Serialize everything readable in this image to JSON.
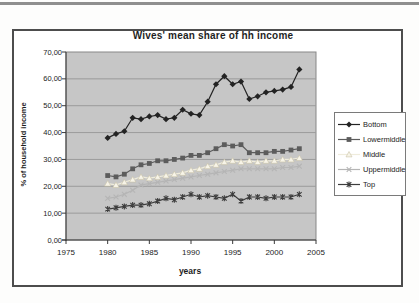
{
  "chart_data": {
    "type": "line",
    "title": "Wives' mean share of hh income",
    "xlabel": "years",
    "ylabel": "% of household income",
    "xlim": [
      1975,
      2005
    ],
    "ylim": [
      0,
      70
    ],
    "x_tick_labels": [
      "1975",
      "1980",
      "1985",
      "1990",
      "1995",
      "2000",
      "2005"
    ],
    "y_tick_labels": [
      "70,00",
      "60,00",
      "50,00",
      "40,00",
      "30,00",
      "20,00",
      "10,00",
      "0,00"
    ],
    "grid": true,
    "legend_position": "right",
    "plot_bg_color": "#c6c6c6",
    "gridline_color": "#9b9b9b",
    "x": [
      1980,
      1981,
      1982,
      1983,
      1984,
      1985,
      1986,
      1987,
      1988,
      1989,
      1990,
      1991,
      1992,
      1993,
      1994,
      1995,
      1996,
      1997,
      1998,
      1999,
      2000,
      2001,
      2002,
      2003
    ],
    "series": [
      {
        "name": "Bottom",
        "marker": "diamond",
        "color": "#232323",
        "values": [
          38,
          39.5,
          40.5,
          45.5,
          45,
          46,
          46.5,
          45,
          45.5,
          48.5,
          47,
          46.5,
          51.5,
          58,
          61,
          58,
          59,
          52.5,
          53.5,
          55,
          55.5,
          56,
          57,
          63.5
        ]
      },
      {
        "name": "Lowermiddle",
        "marker": "square",
        "color": "#5c5c5c",
        "values": [
          24,
          23.5,
          24.5,
          26.5,
          28,
          28.5,
          29.5,
          29.5,
          30,
          30.5,
          31.5,
          31.5,
          32.5,
          34,
          35.5,
          35,
          35.5,
          32.5,
          32.5,
          32.5,
          33,
          33,
          33.5,
          34
        ]
      },
      {
        "name": "Middle",
        "marker": "triangle",
        "color": "#efecdc",
        "fill": "#f7f4e8",
        "edge": "#c9c3a8",
        "values": [
          21,
          20.5,
          21.5,
          22.5,
          23.5,
          23,
          23.5,
          24,
          24.5,
          25,
          26,
          26.5,
          27.5,
          28,
          29,
          29.5,
          29,
          29.5,
          29,
          29.5,
          29.5,
          30,
          30,
          30.5
        ]
      },
      {
        "name": "Uppermiddle",
        "marker": "x",
        "color": "#b5b5b5",
        "values": [
          15.5,
          16,
          17,
          18.5,
          20.5,
          21,
          21.5,
          22,
          22.5,
          23,
          23.5,
          24,
          24.5,
          25,
          25.5,
          26,
          26.5,
          26.5,
          26.5,
          26.5,
          26.5,
          27,
          27,
          27.5
        ]
      },
      {
        "name": "Top",
        "marker": "star",
        "color": "#3d3d3d",
        "values": [
          11.5,
          12,
          12.5,
          13,
          13,
          13.5,
          14.5,
          15.5,
          15,
          16,
          17,
          16,
          16.5,
          16,
          15.5,
          17,
          14.5,
          16,
          16,
          15.5,
          16,
          16,
          16,
          17
        ]
      }
    ]
  }
}
